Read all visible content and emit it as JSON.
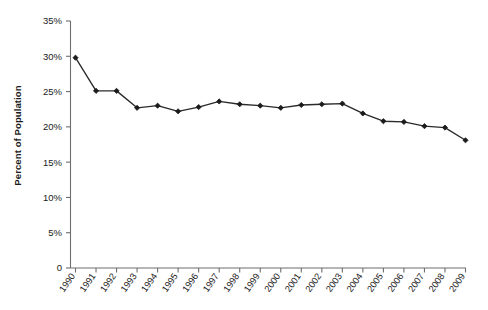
{
  "chart_data": {
    "type": "line",
    "title": "",
    "xlabel": "",
    "ylabel": "Percent of Population",
    "categories": [
      "1990",
      "1991",
      "1992",
      "1993",
      "1994",
      "1995",
      "1996",
      "1997",
      "1998",
      "1999",
      "2000",
      "2001",
      "2002",
      "2003",
      "2004",
      "2005",
      "2006",
      "2007",
      "2008",
      "2009"
    ],
    "values": [
      29.8,
      25.1,
      25.1,
      22.7,
      23.0,
      22.2,
      22.8,
      23.6,
      23.2,
      23.0,
      22.7,
      23.1,
      23.2,
      23.3,
      21.9,
      20.8,
      20.7,
      20.1,
      19.9,
      18.1
    ],
    "ylim": [
      0,
      35
    ],
    "ytick_values": [
      0,
      5,
      10,
      15,
      20,
      25,
      30,
      35
    ],
    "ytick_labels": [
      "0",
      "5%",
      "10%",
      "15%",
      "20%",
      "25%",
      "30%",
      "35%"
    ],
    "grid": false,
    "legend": "none",
    "series_color": "#1b1b1b",
    "axis_color": "#6e6e6e",
    "marker": "diamond"
  },
  "axis": {
    "y_title": "Percent of Population"
  }
}
